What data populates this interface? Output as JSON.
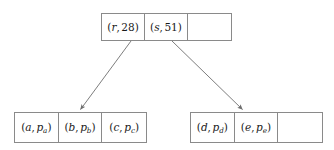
{
  "figure": {
    "kind": "b-tree-index-diagram",
    "width": 334,
    "height": 150,
    "background_color": "#ffffff",
    "line_color": "#8a8a8a",
    "text_color": "#1a1a1a"
  },
  "nodes": {
    "root": {
      "name": "root-node",
      "cells": [
        {
          "label": "(r, 28)",
          "var": "r",
          "sub": "",
          "value": "28",
          "empty": false
        },
        {
          "label": "(s, 51)",
          "var": "s",
          "sub": "",
          "value": "51",
          "empty": false
        },
        {
          "label": "",
          "var": "",
          "sub": "",
          "value": "",
          "empty": true
        }
      ]
    },
    "left_leaf": {
      "name": "left-leaf-node",
      "cells": [
        {
          "label": "(a, pa)",
          "var": "a",
          "sub": "a",
          "value": "p",
          "empty": false
        },
        {
          "label": "(b, pb)",
          "var": "b",
          "sub": "b",
          "value": "p",
          "empty": false
        },
        {
          "label": "(c, pc)",
          "var": "c",
          "sub": "c",
          "value": "p",
          "empty": false
        }
      ]
    },
    "right_leaf": {
      "name": "right-leaf-node",
      "cells": [
        {
          "label": "(d, pd)",
          "var": "d",
          "sub": "d",
          "value": "p",
          "empty": false
        },
        {
          "label": "(e, pe)",
          "var": "e",
          "sub": "e",
          "value": "p",
          "empty": false
        },
        {
          "label": "",
          "var": "",
          "sub": "",
          "value": "",
          "empty": true
        }
      ]
    }
  },
  "arrows": [
    {
      "name": "root-to-left-leaf",
      "from_x": 131,
      "from_y": 41,
      "to_x": 80,
      "to_y": 110
    },
    {
      "name": "root-to-right-leaf",
      "from_x": 172,
      "from_y": 41,
      "to_x": 243,
      "to_y": 110
    }
  ],
  "glyphs": {
    "open_paren": "(",
    "close_paren": ")",
    "comma": ","
  }
}
